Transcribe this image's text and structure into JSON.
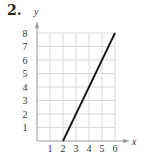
{
  "problem_number": "2.",
  "chart_data": {
    "type": "line",
    "title": "",
    "xlabel": "x",
    "ylabel": "y",
    "xlim": [
      0,
      6
    ],
    "ylim": [
      0,
      8
    ],
    "x_ticks": [
      "1",
      "2",
      "3",
      "4",
      "5",
      "6"
    ],
    "y_ticks": [
      "1",
      "2",
      "3",
      "4",
      "5",
      "6",
      "7",
      "8"
    ],
    "grid": true,
    "series": [
      {
        "name": "line",
        "x": [
          2,
          6
        ],
        "y": [
          0,
          8
        ],
        "color": "#111111"
      }
    ]
  },
  "colors": {
    "grid": "#d9d9d9",
    "axis": "#999999",
    "line": "#111111"
  }
}
